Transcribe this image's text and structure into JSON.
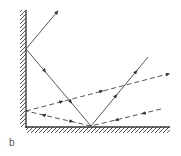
{
  "figure": {
    "panel_label": "b",
    "colors": {
      "line": "#444444",
      "hatch": "#444444",
      "background": "#ffffff"
    }
  },
  "mirrors": {
    "vertical": {
      "x": 26,
      "y1": 10,
      "y2": 127
    },
    "horizontal": {
      "y": 127,
      "x1": 26,
      "x2": 170
    }
  },
  "rays": [
    {
      "name": "solid-ray",
      "style": "solid",
      "points": [
        [
          148,
          57
        ],
        [
          91,
          126
        ],
        [
          26,
          49
        ],
        [
          57,
          12
        ]
      ]
    },
    {
      "name": "dashed-ray-upper",
      "style": "dashed",
      "points": [
        [
          26,
          111
        ],
        [
          168,
          74
        ]
      ]
    },
    {
      "name": "dashed-ray-lower",
      "style": "dashed",
      "points": [
        [
          161,
          109
        ],
        [
          91,
          126
        ],
        [
          26,
          111
        ]
      ]
    }
  ]
}
